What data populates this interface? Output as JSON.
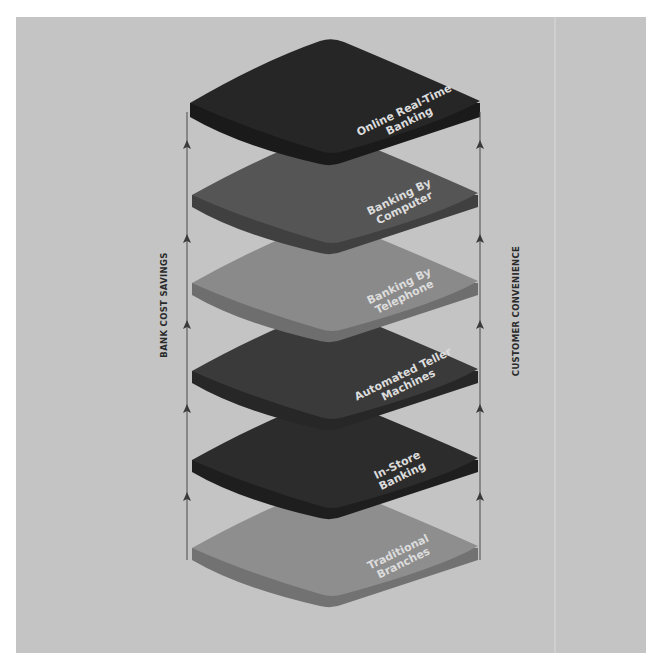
{
  "diagram": {
    "axes": {
      "left_label": "BANK COST SAVINGS",
      "right_label": "CUSTOMER CONVENIENCE",
      "arrow_direction": "up"
    },
    "layers": [
      {
        "line1": "Online Real-Time",
        "line2": "Banking",
        "color": "#262626",
        "side": "#1a1a1a"
      },
      {
        "line1": "Banking By",
        "line2": "Computer",
        "color": "#555555",
        "side": "#404040"
      },
      {
        "line1": "Banking By",
        "line2": "Telephone",
        "color": "#8a8a8a",
        "side": "#6e6e6e"
      },
      {
        "line1": "Automated Teller",
        "line2": "Machines",
        "color": "#3a3a3a",
        "side": "#272727"
      },
      {
        "line1": "In-Store",
        "line2": "Banking",
        "color": "#2c2c2c",
        "side": "#1e1e1e"
      },
      {
        "line1": "Traditional",
        "line2": "Branches",
        "color": "#8e8e8e",
        "side": "#727272"
      }
    ],
    "colors": {
      "background": "#c4c4c4",
      "line": "#4a4a4a",
      "label_text": "#dcdcdc"
    }
  }
}
